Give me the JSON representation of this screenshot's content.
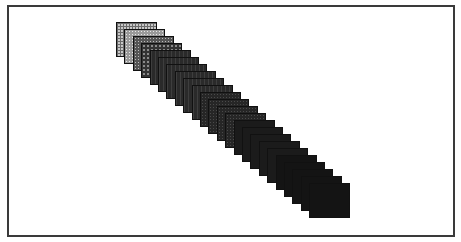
{
  "figure": {
    "frame_color": "#3a3a3a",
    "background_color": "#ffffff",
    "tile_count": 24,
    "tile_size": {
      "width": 41,
      "height": 35
    },
    "start": {
      "x": 116,
      "y": 22
    },
    "step": {
      "dx": 8.4,
      "dy": 7.0
    },
    "tiles": [
      {
        "index": 1,
        "pattern": "grid"
      },
      {
        "index": 2,
        "pattern": "check-light"
      },
      {
        "index": 3,
        "pattern": "check-mid"
      },
      {
        "index": 4,
        "pattern": "check-dark"
      },
      {
        "index": 5,
        "pattern": "hatch"
      },
      {
        "index": 6,
        "pattern": "hatch"
      },
      {
        "index": 7,
        "pattern": "hatch"
      },
      {
        "index": 8,
        "pattern": "hatch"
      },
      {
        "index": 9,
        "pattern": "hatch"
      },
      {
        "index": 10,
        "pattern": "hatch"
      },
      {
        "index": 11,
        "pattern": "dots-dark"
      },
      {
        "index": 12,
        "pattern": "dots-dark"
      },
      {
        "index": 13,
        "pattern": "dots-dark"
      },
      {
        "index": 14,
        "pattern": "dots-dark"
      },
      {
        "index": 15,
        "pattern": "solid"
      },
      {
        "index": 16,
        "pattern": "solid"
      },
      {
        "index": 17,
        "pattern": "solid"
      },
      {
        "index": 18,
        "pattern": "solid"
      },
      {
        "index": 19,
        "pattern": "solid"
      },
      {
        "index": 20,
        "pattern": "black"
      },
      {
        "index": 21,
        "pattern": "black"
      },
      {
        "index": 22,
        "pattern": "black"
      },
      {
        "index": 23,
        "pattern": "black"
      },
      {
        "index": 24,
        "pattern": "black"
      }
    ]
  }
}
